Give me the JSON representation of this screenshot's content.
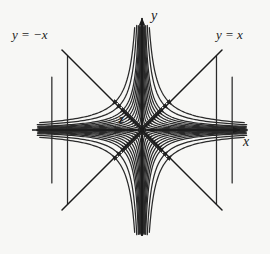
{
  "figure": {
    "domain": "diagram",
    "kind": "phase-portrait",
    "background_color": "#f7f7f5",
    "stroke_color": "#2a2a2a",
    "axes": {
      "x_label": "x",
      "y_label": "y",
      "origin_px": [
        142,
        130
      ],
      "x_axis_from_px": [
        32,
        130
      ],
      "x_axis_to_px": [
        246,
        130
      ],
      "y_axis_from_px": [
        142,
        236
      ],
      "y_axis_to_px": [
        142,
        12
      ]
    },
    "labels": {
      "asymptote_negative": "y = −x",
      "asymptote_positive": "y = x",
      "stagnation_point": "z"
    }
  },
  "chart_data": {
    "type": "line",
    "title": "",
    "xlabel": "x",
    "ylabel": "y",
    "subtype": "streamline-phase-portrait",
    "grid": false,
    "legend": false,
    "xlim": [
      -110,
      110
    ],
    "ylim": [
      -110,
      110
    ],
    "asymptotes": [
      {
        "name": "y = x",
        "slope": 1,
        "intercept": 0,
        "label_position": "top-right"
      },
      {
        "name": "y = −x",
        "slope": -1,
        "intercept": 0,
        "label_position": "top-left"
      }
    ],
    "stagnation_points": [
      {
        "label": "z",
        "x": 0,
        "y": 0,
        "type": "saddle"
      }
    ],
    "streamline_family": "xy = c",
    "streamline_constants": [
      4,
      16,
      36,
      64,
      100,
      144,
      196,
      256,
      324,
      400,
      576,
      784
    ],
    "flow_field": {
      "u": "x",
      "v": "-y"
    },
    "arrow_direction_by_quadrant": {
      "quadrant_I": "up-left (inflow along y-axis, outflow toward y = x)",
      "quadrant_II": "up-right then left (outflow along y = −x)",
      "quadrant_III": "down-right (outflow along y = x direction)",
      "quadrant_IV": "down-left (outflow along y = −x direction)"
    },
    "arrow_count": 60
  }
}
